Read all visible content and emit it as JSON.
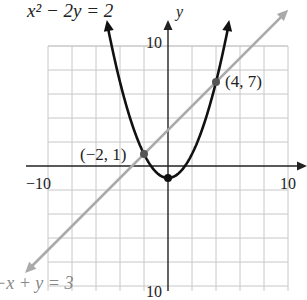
{
  "chart_data": {
    "type": "line",
    "title": "",
    "xlabel": "",
    "ylabel": "y",
    "xlim": [
      -10,
      10
    ],
    "ylim": [
      -10,
      10
    ],
    "grid": true,
    "grid_step": 2,
    "tick_labels": {
      "x_min": "−10",
      "x_max": "10",
      "y_max": "10",
      "y_min": "10"
    },
    "series": [
      {
        "name": "x² − 2y = 2",
        "kind": "parabola",
        "equation": "y = (x^2 - 2)/2",
        "color": "#111111",
        "vertex": [
          0,
          -1
        ]
      },
      {
        "name": "−x + y = 3",
        "kind": "line",
        "equation": "y = x + 3",
        "color": "#aaaaaa"
      }
    ],
    "annotations": [
      {
        "label": "(−2, 1)",
        "x": -2,
        "y": 1
      },
      {
        "label": "(4, 7)",
        "x": 4,
        "y": 7
      }
    ]
  },
  "labels": {
    "parabola_eq": "x² − 2y = 2",
    "line_eq": "−x + y = 3",
    "y_axis": "y",
    "x_min": "−10",
    "x_max": "10",
    "y_max": "10",
    "y_min": "10",
    "point_a": "(−2, 1)",
    "point_b": "(4, 7)"
  }
}
